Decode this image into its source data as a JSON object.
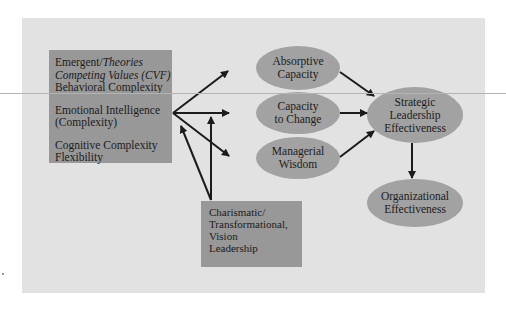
{
  "diagram": {
    "type": "flow-diagram",
    "colors": {
      "page_background": "#ffffff",
      "panel_background": "#e2e2e2",
      "box_fill": "#989898",
      "ellipse_fill": "#a2a2a2",
      "arrow_color": "#1b1b1b"
    },
    "left_box": {
      "groups": [
        {
          "line1_plain": "Emergent/",
          "line1_italic": "Theories",
          "line2_italic": "Competing Values (CVF)",
          "line3": "Behavioral Complexity"
        },
        {
          "line1": "Emotional Intelligence",
          "line2": "(Complexity)"
        },
        {
          "line1": "Cognitive Complexity",
          "line2": "Flexibility"
        }
      ]
    },
    "bottom_box": {
      "lines": [
        "Charismatic/",
        "Transformational,",
        "Vision",
        "Leadership"
      ]
    },
    "ellipses": {
      "absorptive": {
        "lines": [
          "Absorptive",
          "Capacity"
        ]
      },
      "capacity_change": {
        "lines": [
          "Capacity",
          "to Change"
        ]
      },
      "wisdom": {
        "lines": [
          "Managerial",
          "Wisdom"
        ]
      },
      "strategic": {
        "lines": [
          "Strategic",
          "Leadership",
          "Effectiveness"
        ]
      },
      "organizational": {
        "lines": [
          "Organizational",
          "Effectiveness"
        ]
      }
    },
    "edges": [
      {
        "from": "left_box",
        "to": "absorptive"
      },
      {
        "from": "left_box",
        "to": "capacity_change"
      },
      {
        "from": "left_box",
        "to": "wisdom"
      },
      {
        "from": "bottom_box",
        "to": "left_box"
      },
      {
        "from": "bottom_box",
        "to": "left_box_to_capacity_change_edge"
      },
      {
        "from": "absorptive",
        "to": "strategic"
      },
      {
        "from": "capacity_change",
        "to": "strategic"
      },
      {
        "from": "wisdom",
        "to": "strategic"
      },
      {
        "from": "strategic",
        "to": "organizational"
      }
    ]
  }
}
